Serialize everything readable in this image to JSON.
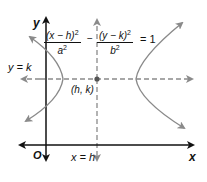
{
  "diagram": {
    "type": "hyperbola-horizontal-transverse-axis",
    "equation": {
      "term1_numerator": "(x − h)",
      "term1_numerator_exp": "2",
      "term1_denominator": "a",
      "term1_denominator_exp": "2",
      "operator": "−",
      "term2_numerator": "(y − k)",
      "term2_numerator_exp": "2",
      "term2_denominator": "b",
      "term2_denominator_exp": "2",
      "equals": "= 1"
    },
    "labels": {
      "y_axis": "y",
      "x_axis": "x",
      "origin": "O",
      "horizontal_line": "y = k",
      "vertical_line": "x = h",
      "center": "(h, k)"
    },
    "colors": {
      "axis": "#111111",
      "curve": "#8a8a8a",
      "dashed": "#8a8a8a",
      "center_point": "#555555"
    }
  }
}
